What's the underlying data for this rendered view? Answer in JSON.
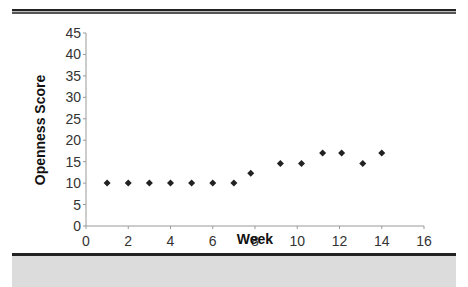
{
  "chart_data": {
    "type": "scatter",
    "title": "",
    "xlabel": "Week",
    "ylabel": "Openness Score",
    "xlim": [
      0,
      16
    ],
    "ylim": [
      0,
      45
    ],
    "xticks": [
      0,
      2,
      4,
      6,
      8,
      10,
      12,
      14,
      16
    ],
    "yticks": [
      0,
      5,
      10,
      15,
      20,
      25,
      30,
      35,
      40,
      45
    ],
    "grid": false,
    "legend": null,
    "marker": "diamond",
    "marker_color": "#222222",
    "series": [
      {
        "name": "Openness Score",
        "x": [
          1,
          2,
          3,
          4,
          5,
          6,
          7,
          7.8,
          9.2,
          10.2,
          11.2,
          12.1,
          13.1,
          14
        ],
        "y": [
          10,
          10,
          10,
          10,
          10,
          10,
          10,
          12.3,
          14.6,
          14.6,
          17,
          17,
          14.6,
          17
        ]
      }
    ]
  }
}
